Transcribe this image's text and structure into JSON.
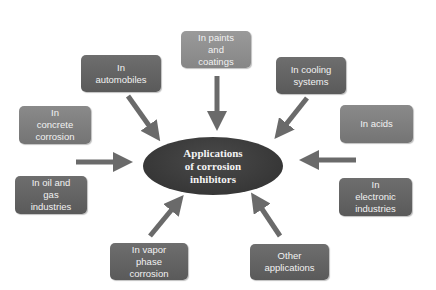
{
  "diagram": {
    "center": {
      "label": "Applications\nof corrosion\ninhibitors"
    },
    "nodes": [
      {
        "id": "paints",
        "label": "In paints\nand\ncoatings"
      },
      {
        "id": "automobiles",
        "label": "In\nautomobiles"
      },
      {
        "id": "cooling",
        "label": "In cooling\nsystems"
      },
      {
        "id": "concrete",
        "label": "In\nconcrete\ncorrosion"
      },
      {
        "id": "acids",
        "label": "In acids"
      },
      {
        "id": "oil-gas",
        "label": "In oil and\ngas\nindustries"
      },
      {
        "id": "electronic",
        "label": "In\nelectronic\nindustries"
      },
      {
        "id": "vapor",
        "label": "In vapor\nphase\ncorrosion"
      },
      {
        "id": "other",
        "label": "Other\napplications"
      }
    ],
    "colors": {
      "box_dark": "#626262",
      "box_light": "#8c8c8c",
      "center": "#3a3a3a",
      "arrow": "#6a6a6a"
    }
  }
}
